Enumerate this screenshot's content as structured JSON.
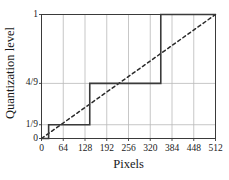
{
  "chart_data": {
    "type": "line",
    "title": "",
    "xlabel": "Pixels",
    "ylabel": "Quantization level",
    "xlim": [
      0,
      512
    ],
    "ylim": [
      0,
      1
    ],
    "grid": true,
    "legend": "none",
    "xticks": [
      0,
      64,
      128,
      192,
      256,
      320,
      384,
      448,
      512
    ],
    "xtick_labels": [
      "0",
      "64",
      "128",
      "192",
      "256",
      "320",
      "384",
      "448",
      "512"
    ],
    "yticks": [
      0,
      0.1111,
      0.4444,
      1
    ],
    "ytick_labels": [
      "0",
      "1/9",
      "4/9",
      "1"
    ],
    "y_gridlines": [
      0.1111,
      0.4444
    ],
    "series": [
      {
        "name": "Quantization staircase",
        "style": "solid",
        "color": "#3a3a3a",
        "width": 1.6,
        "type": "step",
        "steps": [
          {
            "x_start": 0,
            "x_end": 21,
            "level": 0,
            "level_label": "0"
          },
          {
            "x_start": 21,
            "x_end": 142,
            "level": 0.1111,
            "level_label": "1/9"
          },
          {
            "x_start": 142,
            "x_end": 351,
            "level": 0.4444,
            "level_label": "4/9"
          },
          {
            "x_start": 351,
            "x_end": 512,
            "level": 1,
            "level_label": "1"
          }
        ],
        "points": [
          {
            "x": 0,
            "y": 0
          },
          {
            "x": 21,
            "y": 0
          },
          {
            "x": 21,
            "y": 0.1111
          },
          {
            "x": 142,
            "y": 0.1111
          },
          {
            "x": 142,
            "y": 0.4444
          },
          {
            "x": 351,
            "y": 0.4444
          },
          {
            "x": 351,
            "y": 1
          },
          {
            "x": 512,
            "y": 1
          }
        ]
      },
      {
        "name": "Ideal linear response",
        "style": "dashed",
        "color": "#2b2b2b",
        "width": 1.5,
        "type": "line",
        "points": [
          {
            "x": 0,
            "y": 0
          },
          {
            "x": 512,
            "y": 1
          }
        ]
      }
    ]
  },
  "figure": {
    "axis_title_y": "Quantization level",
    "axis_title_x": "Pixels"
  }
}
